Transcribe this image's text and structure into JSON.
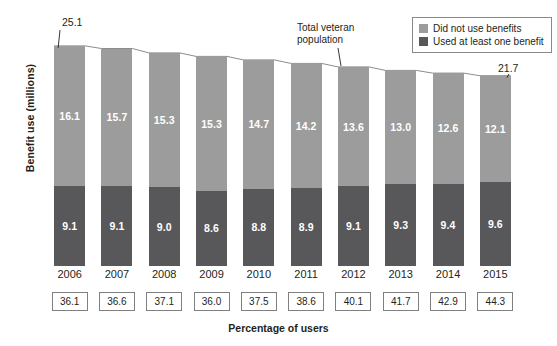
{
  "chart_data": {
    "type": "bar",
    "subtype": "stacked-bar",
    "title": "",
    "xlabel": "Percentage of users",
    "ylabel": "Benefit use (millions)",
    "grid": false,
    "ylim": [
      0,
      26
    ],
    "categories": [
      "2006",
      "2007",
      "2008",
      "2009",
      "2010",
      "2011",
      "2012",
      "2013",
      "2014",
      "2015"
    ],
    "series": [
      {
        "name": "Did not use benefits",
        "color": "#9c9c9c",
        "values": [
          16.1,
          15.7,
          15.3,
          15.3,
          14.7,
          14.2,
          13.6,
          13.0,
          12.6,
          12.1
        ]
      },
      {
        "name": "Used at least one benefit",
        "color": "#58585a",
        "values": [
          9.1,
          9.1,
          9.0,
          8.6,
          8.8,
          8.9,
          9.1,
          9.3,
          9.4,
          9.6
        ]
      }
    ],
    "totals": [
      25.1,
      24.8,
      24.3,
      23.9,
      23.5,
      23.1,
      22.7,
      22.3,
      22.0,
      21.7
    ],
    "percentage_of_users": [
      "36.1",
      "36.6",
      "37.1",
      "36.0",
      "37.5",
      "38.6",
      "40.1",
      "41.7",
      "42.9",
      "44.3"
    ],
    "annotations": [
      {
        "name": "first-total",
        "text": "25.1"
      },
      {
        "name": "last-total",
        "text": "21.7"
      },
      {
        "name": "trendline-label",
        "line1": "Total veteran",
        "line2": "population"
      }
    ],
    "legend": {
      "position": "top-right",
      "entries": [
        {
          "label": "Did not use benefits",
          "color": "#9c9c9c"
        },
        {
          "label": "Used at least one benefit",
          "color": "#58585a"
        }
      ]
    }
  },
  "axes": {
    "y_title": "Benefit use (millions)",
    "x_title": "Percentage of users"
  },
  "callouts": {
    "first_total": "25.1",
    "last_total": "21.7",
    "trend_line1": "Total veteran",
    "trend_line2": "population"
  },
  "legend": {
    "entry0_label": "Did not use benefits",
    "entry1_label": "Used at least one benefit"
  }
}
